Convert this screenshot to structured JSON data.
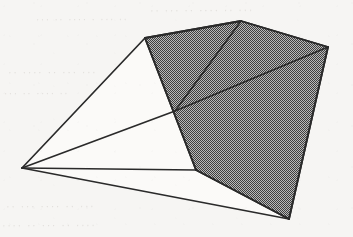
{
  "figure": {
    "kind": "line-drawing",
    "canvas": {
      "width": 353,
      "height": 237
    },
    "colors": {
      "background": "#f6f5f3",
      "paper": "#f2f0ed",
      "stroke": "#2a2a2a",
      "shade_fill": "#8a8a8a",
      "shade_dot_dark": "#4a4a4a",
      "white_face": "#fbfaf8",
      "ghost_text": "#cdc9c4"
    },
    "stroke_width": 1.8,
    "vertices": {
      "apex": {
        "name": "apex-vertex",
        "x": 22,
        "y": 168
      },
      "top_left": {
        "name": "top-left-vertex",
        "x": 145,
        "y": 38
      },
      "peak": {
        "name": "top-peak-vertex",
        "x": 241,
        "y": 21
      },
      "right": {
        "name": "right-vertex",
        "x": 328,
        "y": 47
      },
      "bottom_right": {
        "name": "bottom-right-vertex",
        "x": 289,
        "y": 219
      },
      "mid_left": {
        "name": "mid-left-vertex",
        "x": 196,
        "y": 170
      },
      "crossing": {
        "name": "interior-crossing",
        "x": 175,
        "y": 111
      }
    },
    "shaded_polygon": {
      "label": "shaded-body",
      "points": "145,38 241,21 328,47 289,219 196,170"
    },
    "interior_edges": [
      {
        "label": "peak-to-crossing",
        "x1": 241,
        "y1": 21,
        "x2": 175,
        "y2": 111
      },
      {
        "label": "right-to-crossing",
        "x1": 328,
        "y1": 47,
        "x2": 175,
        "y2": 111
      }
    ],
    "rays": [
      {
        "label": "ray-to-top-left",
        "x1": 22,
        "y1": 168,
        "x2": 145,
        "y2": 38
      },
      {
        "label": "ray-to-crossing",
        "x1": 22,
        "y1": 168,
        "x2": 175,
        "y2": 111
      },
      {
        "label": "ray-to-mid-left",
        "x1": 22,
        "y1": 168,
        "x2": 196,
        "y2": 170
      },
      {
        "label": "ray-to-bottom-right",
        "x1": 22,
        "y1": 168,
        "x2": 289,
        "y2": 219
      }
    ],
    "outline_edges": [
      {
        "label": "edge-topleft-peak",
        "x1": 145,
        "y1": 38,
        "x2": 241,
        "y2": 21
      },
      {
        "label": "edge-peak-right",
        "x1": 241,
        "y1": 21,
        "x2": 328,
        "y2": 47
      },
      {
        "label": "edge-right-bottomright",
        "x1": 328,
        "y1": 47,
        "x2": 289,
        "y2": 219
      },
      {
        "label": "edge-bottomright-midleft",
        "x1": 289,
        "y1": 219,
        "x2": 196,
        "y2": 170
      },
      {
        "label": "edge-midleft-topleft",
        "x1": 196,
        "y1": 170,
        "x2": 145,
        "y2": 38
      }
    ],
    "ghost_marks": [
      {
        "text": "·· ··· ·· ···· ·· ···",
        "x": 150,
        "y": 4,
        "size": 11,
        "rot": -0.4
      },
      {
        "text": "··· ·· ···· · ··· ··",
        "x": 36,
        "y": 14,
        "size": 10,
        "rot": -0.3
      },
      {
        "text": "·· ···· ·· ··· ···",
        "x": 8,
        "y": 66,
        "size": 11,
        "rot": -0.2
      },
      {
        "text": "··· ·· ···· ··",
        "x": 4,
        "y": 88,
        "size": 10,
        "rot": -0.2
      },
      {
        "text": "·· ··· ···· ·· ···",
        "x": 6,
        "y": 200,
        "size": 11,
        "rot": -0.3
      },
      {
        "text": "···· ·· ··· ·· ····",
        "x": 2,
        "y": 219,
        "size": 11,
        "rot": -0.3
      }
    ]
  }
}
